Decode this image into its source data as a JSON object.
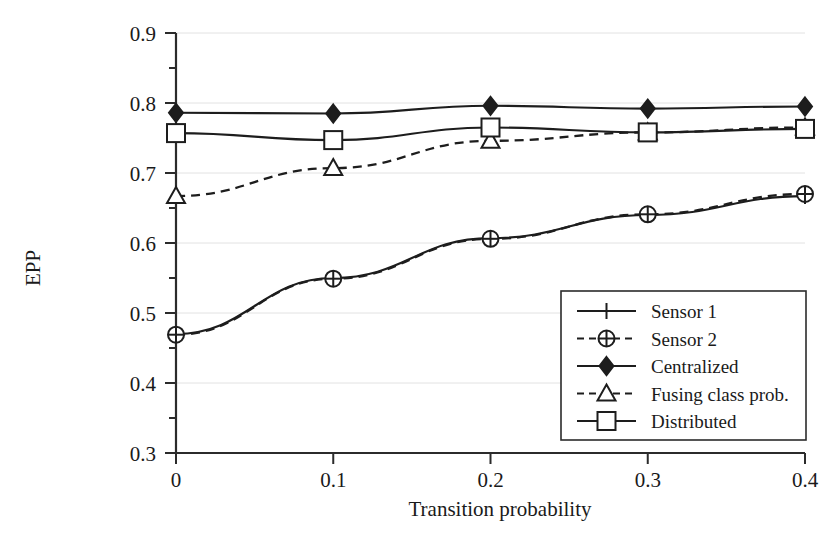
{
  "chart_data": {
    "type": "line",
    "title": "",
    "xlabel": "Transition probability",
    "ylabel": "EPP",
    "x": [
      0,
      0.1,
      0.2,
      0.3,
      0.4
    ],
    "xtick_labels": [
      "0",
      "0.1",
      "0.2",
      "0.3",
      "0.4"
    ],
    "ytick_labels": [
      "0.3",
      "0.4",
      "0.5",
      "0.6",
      "0.7",
      "0.8",
      "0.9"
    ],
    "xlim": [
      0,
      0.4
    ],
    "ylim": [
      0.3,
      0.9
    ],
    "grid": true,
    "grid_axis": "y",
    "legend_position": "lower-right",
    "minor_tick_step": 0.05,
    "series": [
      {
        "name": "Sensor 1",
        "values": [
          0.47,
          0.55,
          0.607,
          0.64,
          0.667
        ],
        "style": "solid",
        "marker": "plus",
        "color": "#1d1d1d"
      },
      {
        "name": "Sensor 2",
        "values": [
          0.469,
          0.549,
          0.606,
          0.641,
          0.67
        ],
        "style": "dashed",
        "marker": "circle-plus",
        "color": "#1d1d1d"
      },
      {
        "name": "Centralized",
        "values": [
          0.786,
          0.785,
          0.796,
          0.792,
          0.795
        ],
        "style": "solid",
        "marker": "diamond-filled",
        "color": "#1d1d1d"
      },
      {
        "name": "Fusing class prob.",
        "values": [
          0.667,
          0.707,
          0.746,
          0.758,
          0.765
        ],
        "style": "dashed",
        "marker": "triangle",
        "color": "#1d1d1d"
      },
      {
        "name": "Distributed",
        "values": [
          0.757,
          0.747,
          0.765,
          0.758,
          0.763
        ],
        "style": "solid",
        "marker": "square",
        "color": "#1d1d1d"
      }
    ]
  },
  "legend": {
    "items": [
      {
        "label": "Sensor 1"
      },
      {
        "label": "Sensor 2"
      },
      {
        "label": "Centralized"
      },
      {
        "label": "Fusing class prob."
      },
      {
        "label": "Distributed"
      }
    ]
  }
}
